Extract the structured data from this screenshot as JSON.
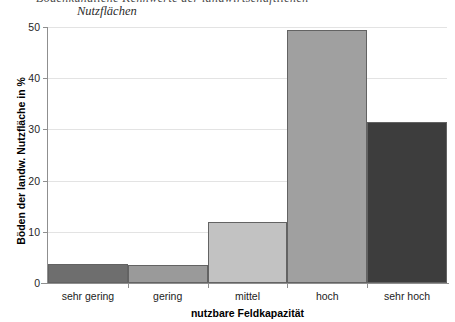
{
  "caption": {
    "cut_line": "Bodenkundliche Kennwerte der landwirtschaftlichen",
    "line2": "Nutzflächen"
  },
  "chart_data": {
    "type": "bar",
    "title": "",
    "categories": [
      "sehr gering",
      "gering",
      "mittel",
      "hoch",
      "sehr hoch"
    ],
    "values": [
      3.7,
      3.6,
      11.9,
      49.5,
      31.4
    ],
    "xlabel": "nutzbare Feldkapazität",
    "ylabel": "Böden der landw. Nutzfläche in %",
    "ylim": [
      0,
      50
    ],
    "yticks": [
      0,
      10,
      20,
      30,
      40,
      50
    ],
    "ytick_labels": [
      "0",
      "10",
      "20",
      "30",
      "40",
      "50"
    ],
    "grid": true,
    "legend": "none",
    "bar_colors": [
      "#6e6e6e",
      "#9a9a9a",
      "#c2c2c2",
      "#a0a0a0",
      "#3d3d3d"
    ],
    "bar_edge_color": "#636363",
    "grid_color": "#e3e3e3",
    "axis_color": "#8f8f8f"
  }
}
